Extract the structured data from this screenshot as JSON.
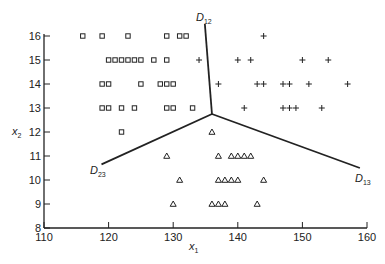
{
  "chart_data": {
    "type": "scatter",
    "title": "",
    "xlabel": "x1",
    "ylabel": "x2",
    "xlim": [
      110,
      160
    ],
    "ylim": [
      8,
      16
    ],
    "xticks": [
      110,
      120,
      130,
      140,
      150,
      160
    ],
    "yticks": [
      8,
      9,
      10,
      11,
      12,
      13,
      14,
      15,
      16
    ],
    "grid": false,
    "legend": "none",
    "series": [
      {
        "name": "class 1",
        "marker": "square",
        "points": [
          [
            116,
            16
          ],
          [
            119,
            16
          ],
          [
            123,
            16
          ],
          [
            129,
            16
          ],
          [
            131,
            16
          ],
          [
            132,
            16
          ],
          [
            120,
            15
          ],
          [
            121,
            15
          ],
          [
            122,
            15
          ],
          [
            123,
            15
          ],
          [
            124,
            15
          ],
          [
            125,
            15
          ],
          [
            127,
            15
          ],
          [
            129,
            15
          ],
          [
            119,
            14
          ],
          [
            120,
            14
          ],
          [
            125,
            14
          ],
          [
            128,
            14
          ],
          [
            129,
            14
          ],
          [
            130,
            14
          ],
          [
            119,
            13
          ],
          [
            120,
            13
          ],
          [
            122,
            13
          ],
          [
            124,
            13
          ],
          [
            129,
            13
          ],
          [
            130,
            13
          ],
          [
            133,
            13
          ],
          [
            122,
            12
          ]
        ]
      },
      {
        "name": "class 2",
        "marker": "plus",
        "points": [
          [
            144,
            16
          ],
          [
            134,
            15
          ],
          [
            140,
            15
          ],
          [
            142,
            15
          ],
          [
            150,
            15
          ],
          [
            154,
            15
          ],
          [
            137,
            14
          ],
          [
            143,
            14
          ],
          [
            144,
            14
          ],
          [
            147,
            14
          ],
          [
            148,
            14
          ],
          [
            151,
            14
          ],
          [
            157,
            14
          ],
          [
            141,
            13
          ],
          [
            147,
            13
          ],
          [
            148,
            13
          ],
          [
            149,
            13
          ],
          [
            153,
            13
          ]
        ]
      },
      {
        "name": "class 3",
        "marker": "triangle",
        "points": [
          [
            136,
            12
          ],
          [
            129,
            11
          ],
          [
            137,
            11
          ],
          [
            139,
            11
          ],
          [
            140,
            11
          ],
          [
            141,
            11
          ],
          [
            142,
            11
          ],
          [
            131,
            10
          ],
          [
            137,
            10
          ],
          [
            138,
            10
          ],
          [
            139,
            10
          ],
          [
            140,
            10
          ],
          [
            144,
            10
          ],
          [
            130,
            9
          ],
          [
            136,
            9
          ],
          [
            137,
            9
          ],
          [
            138,
            9
          ],
          [
            143,
            9
          ]
        ]
      }
    ],
    "decision_boundaries": [
      {
        "name": "D12",
        "from": [
          136.0,
          12.75
        ],
        "to": [
          134.9,
          16.5
        ]
      },
      {
        "name": "D23",
        "from": [
          136.0,
          12.75
        ],
        "to": [
          118.9,
          10.65
        ]
      },
      {
        "name": "D13",
        "from": [
          136.0,
          12.75
        ],
        "to": [
          158.9,
          10.5
        ]
      }
    ],
    "annotations": [
      "D12",
      "D23",
      "D13"
    ]
  },
  "labels": {
    "x_axis": "x",
    "x_axis_sub": "1",
    "y_axis": "x",
    "y_axis_sub": "2",
    "d12": "D",
    "d12_sub": "12",
    "d23": "D",
    "d23_sub": "23",
    "d13": "D",
    "d13_sub": "13",
    "xtick_labels": [
      "110",
      "120",
      "130",
      "140",
      "150",
      "160"
    ],
    "ytick_labels": [
      "8",
      "9",
      "10",
      "11",
      "12",
      "13",
      "14",
      "15",
      "16"
    ]
  }
}
